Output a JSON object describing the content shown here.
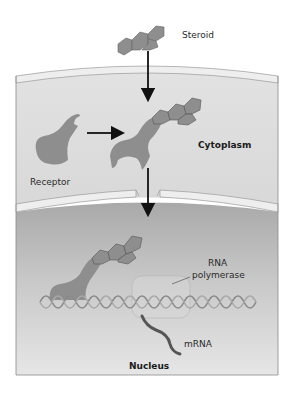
{
  "labels": {
    "steroid": "Steroid",
    "receptor": "Receptor",
    "cytoplasm": "Cytoplasm",
    "rna_polymerase_line1": "RNA",
    "rna_polymerase_line2": "polymerase",
    "mrna": "mRNA",
    "nucleus": "Nucleus"
  },
  "colors": {
    "molecule": "#8e8e8e",
    "molecule_outline": "#5a5a5a",
    "cytoplasm": "#dcdcdc",
    "membrane": "#ececec",
    "nucleus": "#b5b5b5",
    "dna": "#8a8a8a",
    "mrna": "#555555",
    "arrow": "#111111"
  }
}
